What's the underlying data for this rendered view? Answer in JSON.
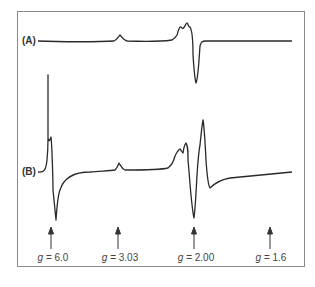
{
  "figure": {
    "traces": [
      {
        "id": "A",
        "label": "(A)"
      },
      {
        "id": "B",
        "label": "(B)"
      }
    ],
    "markers": [
      {
        "g_symbol": "g",
        "eq": " = 6.0",
        "value": "6.0"
      },
      {
        "g_symbol": "g",
        "eq": " = 3.03",
        "value": "3.03"
      },
      {
        "g_symbol": "g",
        "eq": " = 2.00",
        "value": "2.00"
      },
      {
        "g_symbol": "g",
        "eq": " = 1.6",
        "value": "1.6"
      }
    ],
    "colors": {
      "trace": "#2a2a2a",
      "frame": "#8a8a8a",
      "background": "#ffffff"
    }
  }
}
